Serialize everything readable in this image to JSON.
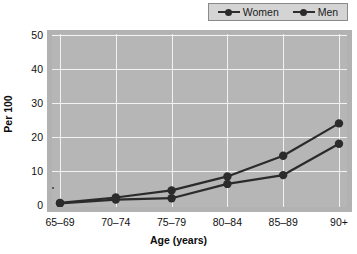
{
  "chart_data": {
    "type": "line",
    "title": "",
    "subtitle": "",
    "xlabel": "Age (years)",
    "ylabel": "Per 100",
    "categories": [
      "65–69",
      "70–74",
      "75–79",
      "80–84",
      "85–89",
      "90+"
    ],
    "series": [
      {
        "name": "Women",
        "values": [
          0.6,
          2.2,
          4.3,
          8.4,
          14.5,
          24.0
        ],
        "color": "#2b2b2b",
        "marker": "circle"
      },
      {
        "name": "Men",
        "values": [
          0.5,
          1.6,
          2.0,
          6.2,
          8.8,
          18.0
        ],
        "color": "#2b2b2b",
        "marker": "circle"
      }
    ],
    "ylim": [
      0,
      50
    ],
    "yticks": [
      0,
      10,
      20,
      30,
      40,
      50
    ],
    "ytick_labels": [
      "0",
      "10",
      "20",
      "30",
      "40",
      "50"
    ],
    "grid": "horizontal-and-vertical",
    "grid_color": "#f2f2f2",
    "plot_background": "#b6b6b6",
    "legend_position": "top-right",
    "legend_entries": [
      "Women",
      "Men"
    ]
  },
  "legend": {
    "items": [
      {
        "label": "Women"
      },
      {
        "label": "Men"
      }
    ]
  },
  "axes": {
    "y_title": "Per 100",
    "x_title": "Age (years)"
  },
  "colors": {
    "line": "#2b2b2b",
    "marker": "#2b2b2b",
    "plot_bg": "#b6b6b6",
    "grid": "#f2f2f2",
    "legend_bg": "#d4d4d4",
    "legend_border": "#8a8a8a",
    "text": "#111111"
  }
}
